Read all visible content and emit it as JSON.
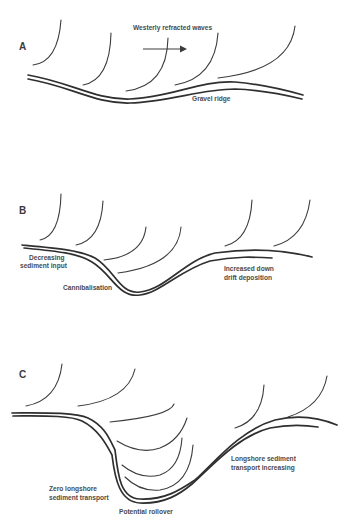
{
  "figure": {
    "panels": [
      {
        "id": "A",
        "label": "A",
        "annotations": {
          "waves_title": "Westerly refracted waves",
          "ridge": "Gravel ridge"
        },
        "arrow_direction": "east"
      },
      {
        "id": "B",
        "label": "B",
        "annotations": {
          "left_line1": "Decreasing",
          "left_line2": "sediment input",
          "center": "Cannibalisation",
          "right_line1": "Increased down",
          "right_line2": "drift deposition"
        }
      },
      {
        "id": "C",
        "label": "C",
        "annotations": {
          "left_line1": "Zero longshore",
          "left_line2": "sediment transport",
          "center": "Potential rollover",
          "right_line1": "Longshore sediment",
          "right_line2": "transport increasing"
        }
      }
    ],
    "colors": {
      "line": "#2f2f2f",
      "text": "#4a4a4a",
      "background": "#ffffff"
    }
  }
}
